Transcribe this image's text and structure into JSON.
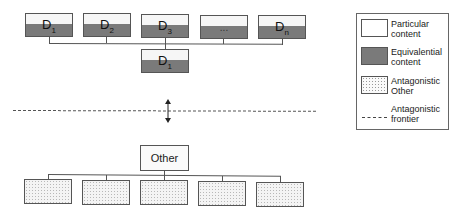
{
  "diagram": {
    "top_row": [
      {
        "label": "D",
        "sub": "1"
      },
      {
        "label": "D",
        "sub": "2"
      },
      {
        "label": "D",
        "sub": "3"
      },
      {
        "label": "...",
        "sub": ""
      },
      {
        "label": "D",
        "sub": "n"
      }
    ],
    "center_node": {
      "label": "D",
      "sub": "1"
    },
    "other_node": {
      "label": "Other"
    },
    "bottom_row_count": 5,
    "frontier_arrow": "↕"
  },
  "legend": {
    "items": [
      {
        "key": "particular",
        "text": "Particular\ncontent"
      },
      {
        "key": "equivalential",
        "text": "Equivalential\ncontent"
      },
      {
        "key": "antagonistic-other",
        "text": "Antagonistic\nOther"
      },
      {
        "key": "antagonistic-frontier",
        "text": "Antagonistic\nfrontier"
      }
    ]
  },
  "colors": {
    "equivalential": "#7a7a7a",
    "particular": "#f6f6f6",
    "border": "#555555"
  }
}
